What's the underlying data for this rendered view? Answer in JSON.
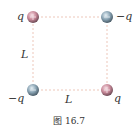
{
  "figure": {
    "caption": "图 16.7",
    "side_length_label_left": "L",
    "side_length_label_bottom": "L",
    "charges": [
      {
        "position": "top-left",
        "label": "q",
        "sign": "positive",
        "color": "#c98a9a"
      },
      {
        "position": "top-right",
        "label": "−q",
        "sign": "negative",
        "color": "#8aa4b4"
      },
      {
        "position": "bottom-left",
        "label": "−q",
        "sign": "negative",
        "color": "#8aa4b4"
      },
      {
        "position": "bottom-right",
        "label": "q",
        "sign": "positive",
        "color": "#c98a9a"
      }
    ],
    "line_color": "#e8b9a8"
  }
}
